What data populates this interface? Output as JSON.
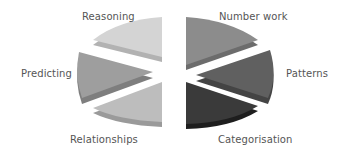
{
  "diagram": {
    "type": "exploded-3d-pie",
    "segments": [
      {
        "id": "reasoning",
        "label": "Reasoning",
        "top": "#d4d4d4",
        "side": "#b2b2b2",
        "label_x": 96,
        "label_y": 9
      },
      {
        "id": "predicting",
        "label": "Predicting",
        "top": "#9e9e9e",
        "side": "#7e7e7e",
        "label_x": 22,
        "label_y": 67
      },
      {
        "id": "relationships",
        "label": "Relationships",
        "top": "#bdbdbd",
        "side": "#9a9a9a",
        "label_x": 70,
        "label_y": 133
      },
      {
        "id": "number-work",
        "label": "Number work",
        "top": "#8c8c8c",
        "side": "#6c6c6c",
        "label_x": 219,
        "label_y": 9
      },
      {
        "id": "patterns",
        "label": "Patterns",
        "top": "#606060",
        "side": "#444444",
        "label_x": 286,
        "label_y": 67
      },
      {
        "id": "categorisation",
        "label": "Categorisation",
        "top": "#3a3a3a",
        "side": "#1e1e1e",
        "label_x": 218,
        "label_y": 133
      }
    ]
  }
}
